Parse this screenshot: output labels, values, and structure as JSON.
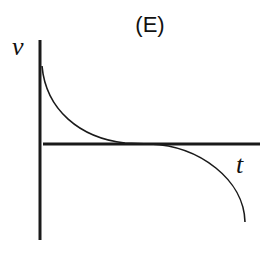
{
  "diagram": {
    "title": "(E)",
    "y_axis_label": "v",
    "x_axis_label": "t",
    "curve_description": "velocity decreases from a positive value, approaches zero tangentially at the t-axis, then decreases increasingly steeply into negative values",
    "colors": {
      "line": "#1a1a1a",
      "background": "#ffffff"
    }
  }
}
